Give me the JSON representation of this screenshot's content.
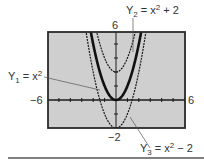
{
  "chart_data": {
    "type": "line",
    "title": "",
    "xlabel": "",
    "ylabel": "",
    "xlim": [
      -6,
      6
    ],
    "ylim": [
      -2,
      6
    ],
    "grid": false,
    "window_labels": {
      "xmin": "−6",
      "xmax": "6",
      "ymin": "−2",
      "ymax": "6"
    },
    "series": [
      {
        "name": "Y1",
        "label": "Y₁ = x²",
        "equation": "x^2",
        "style": "thick",
        "vertex": [
          0,
          0
        ]
      },
      {
        "name": "Y2",
        "label": "Y₂ = x² + 2",
        "equation": "x^2 + 2",
        "style": "dotted",
        "vertex": [
          0,
          2
        ]
      },
      {
        "name": "Y3",
        "label": "Y₃ = x² − 2",
        "equation": "x^2 - 2",
        "style": "dotted",
        "vertex": [
          0,
          -2
        ]
      }
    ]
  },
  "labels": {
    "y1": {
      "base": "Y",
      "sub": "1",
      "rest": " = x",
      "sup": "2",
      "tail": ""
    },
    "y2": {
      "base": "Y",
      "sub": "2",
      "rest": " = x",
      "sup": "2",
      "tail": " + 2"
    },
    "y3": {
      "base": "Y",
      "sub": "3",
      "rest": " = x",
      "sup": "2",
      "tail": " − 2"
    },
    "xmin": "−6",
    "xmax": "6",
    "ymin": "−2",
    "ymax": "6"
  },
  "colors": {
    "plot_bg": "#cfcfcf",
    "frame": "#2a2a2a",
    "curve": "#1a1a1a",
    "leader": "#555555",
    "rule": "#555555"
  }
}
